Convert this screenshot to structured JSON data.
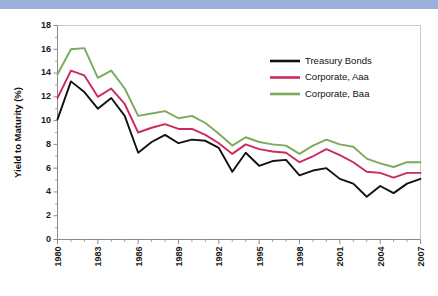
{
  "figure": {
    "banner_color": "#9cb0de",
    "background_color": "#ffffff"
  },
  "chart_data": {
    "type": "line",
    "title": "",
    "xlabel": "",
    "ylabel": "Yield to Maturity (%)",
    "xlim": [
      1980,
      2007
    ],
    "ylim": [
      0,
      18
    ],
    "ytick_step": 2,
    "yticks": [
      0,
      2,
      4,
      6,
      8,
      10,
      12,
      14,
      16,
      18
    ],
    "ytick_labels": [
      "0",
      "2",
      "4",
      "6",
      "8",
      "10",
      "12",
      "14",
      "16",
      "18"
    ],
    "xticks": [
      1980,
      1983,
      1986,
      1989,
      1992,
      1995,
      1998,
      2001,
      2004,
      2007
    ],
    "xtick_labels": [
      "1980",
      "1983",
      "1986",
      "1989",
      "1992",
      "1995",
      "1998",
      "2001",
      "2004",
      "2007"
    ],
    "x": [
      1980,
      1981,
      1982,
      1983,
      1984,
      1985,
      1986,
      1987,
      1988,
      1989,
      1990,
      1991,
      1992,
      1993,
      1994,
      1995,
      1996,
      1997,
      1998,
      1999,
      2000,
      2001,
      2002,
      2003,
      2004,
      2005,
      2006,
      2007
    ],
    "grid": false,
    "legend_position": "upper right",
    "series": [
      {
        "name": "Treasury Bonds",
        "color": "#111111",
        "values": [
          10.1,
          13.3,
          12.4,
          11.0,
          11.9,
          10.4,
          7.3,
          8.2,
          8.8,
          8.1,
          8.4,
          8.3,
          7.7,
          5.7,
          7.3,
          6.2,
          6.6,
          6.7,
          5.4,
          5.8,
          6.0,
          5.1,
          4.7,
          3.6,
          4.5,
          3.9,
          4.7,
          5.1
        ]
      },
      {
        "name": "Corporate, Aaa",
        "color": "#cc2a5c",
        "values": [
          11.9,
          14.2,
          13.8,
          12.0,
          12.7,
          11.4,
          9.0,
          9.4,
          9.7,
          9.3,
          9.3,
          8.8,
          8.1,
          7.2,
          8.0,
          7.6,
          7.4,
          7.3,
          6.5,
          7.0,
          7.6,
          7.1,
          6.5,
          5.7,
          5.6,
          5.2,
          5.6,
          5.6
        ]
      },
      {
        "name": "Corporate, Baa",
        "color": "#7aab59",
        "values": [
          13.9,
          16.0,
          16.1,
          13.6,
          14.2,
          12.7,
          10.4,
          10.6,
          10.8,
          10.2,
          10.4,
          9.8,
          8.9,
          7.9,
          8.6,
          8.2,
          8.0,
          7.9,
          7.2,
          7.9,
          8.4,
          8.0,
          7.8,
          6.8,
          6.4,
          6.1,
          6.5,
          6.5
        ]
      }
    ],
    "legend": [
      {
        "label": "Treasury Bonds",
        "color": "#111111"
      },
      {
        "label": "Corporate, Aaa",
        "color": "#cc2a5c"
      },
      {
        "label": "Corporate, Baa",
        "color": "#7aab59"
      }
    ]
  }
}
